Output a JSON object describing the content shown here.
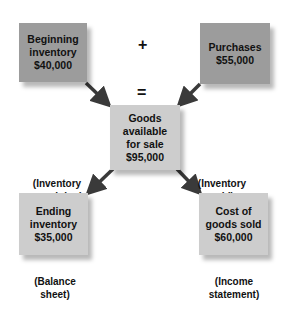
{
  "diagram": {
    "type": "flow",
    "colors": {
      "source_box": "#9c9c9c",
      "derived_box": "#cdcdcd",
      "arrow": "#3a3a3a"
    },
    "operators": {
      "plus": "+",
      "equals": "="
    },
    "boxes": {
      "beginning_inventory": {
        "line1": "Beginning",
        "line2": "inventory",
        "value": "$40,000"
      },
      "purchases": {
        "line1": "Purchases",
        "value": "$55,000"
      },
      "goods_available": {
        "line1": "Goods",
        "line2": "available",
        "line3": "for sale",
        "value": "$95,000"
      },
      "ending_inventory": {
        "line1": "Ending",
        "line2": "inventory",
        "value": "$35,000"
      },
      "cost_of_goods_sold": {
        "line1": "Cost of",
        "line2": "goods sold",
        "value": "$60,000"
      }
    },
    "notes": {
      "inventory_remaining": {
        "line1": "(Inventory",
        "line2": "remaining)"
      },
      "inventory_sold": {
        "line1": "(Inventory",
        "line2": "sold)"
      },
      "balance_sheet": {
        "line1": "(Balance",
        "line2": "sheet)"
      },
      "income_statement": {
        "line1": "(Income",
        "line2": "statement)"
      }
    },
    "edges": [
      {
        "from": "beginning_inventory",
        "to": "goods_available"
      },
      {
        "from": "purchases",
        "to": "goods_available"
      },
      {
        "from": "goods_available",
        "to": "ending_inventory"
      },
      {
        "from": "goods_available",
        "to": "cost_of_goods_sold"
      }
    ]
  }
}
